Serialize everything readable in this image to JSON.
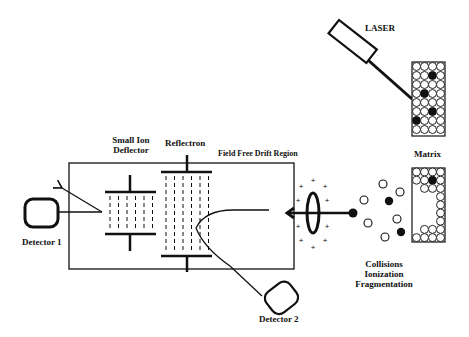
{
  "diagram": {
    "type": "MALDI-TOF mass spectrometer schematic",
    "colors": {
      "stroke": "#111111",
      "background": "#ffffff"
    },
    "labels": {
      "laser": "LASER",
      "matrix": "Matrix",
      "small_ion_deflector_line1": "Small Ion",
      "small_ion_deflector_line2": "Deflector",
      "reflectron": "Reflectron",
      "field_free_drift_region": "Field Free Drift Region",
      "detector1": "Detector 1",
      "detector2": "Detector 2",
      "collisions": "Collisions",
      "ionization": "Ionization",
      "fragmentation": "Fragmentation"
    },
    "components": [
      {
        "id": "laser",
        "label": "LASER",
        "icon": "laser-emitter-icon"
      },
      {
        "id": "sample-matrix",
        "label": "Matrix",
        "icon": "matrix-grid-icon"
      },
      {
        "id": "ion-cloud",
        "label": "Collisions / Ionization / Fragmentation",
        "icon": "ion-particles-icon"
      },
      {
        "id": "extraction-lens",
        "icon": "ring-lens-icon"
      },
      {
        "id": "drift-tube",
        "label": "Field Free Drift Region"
      },
      {
        "id": "reflectron",
        "label": "Reflectron"
      },
      {
        "id": "small-ion-deflector",
        "label": "Small Ion Deflector"
      },
      {
        "id": "detector-1",
        "label": "Detector 1"
      },
      {
        "id": "detector-2",
        "label": "Detector 2"
      }
    ],
    "ion_signs": "+"
  }
}
